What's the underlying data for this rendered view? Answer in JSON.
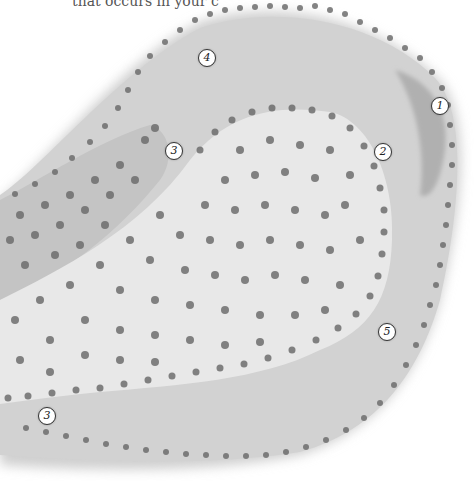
{
  "caption": "that occurs in your c",
  "colors": {
    "background": "#ffffff",
    "channel_fill": "#d0d0d0",
    "channel_dark_zone": "#b4b4b4",
    "inner_region_fill": "#e6e6e6",
    "particle": "#6e6e6e"
  },
  "labels": [
    {
      "id": "1",
      "text": "1",
      "x": 440,
      "y": 106
    },
    {
      "id": "2",
      "text": "2",
      "x": 383,
      "y": 152
    },
    {
      "id": "3a",
      "text": "3",
      "x": 174,
      "y": 151
    },
    {
      "id": "3b",
      "text": "3",
      "x": 47,
      "y": 416
    },
    {
      "id": "4",
      "text": "4",
      "x": 207,
      "y": 58
    },
    {
      "id": "5",
      "text": "5",
      "x": 387,
      "y": 332
    }
  ]
}
